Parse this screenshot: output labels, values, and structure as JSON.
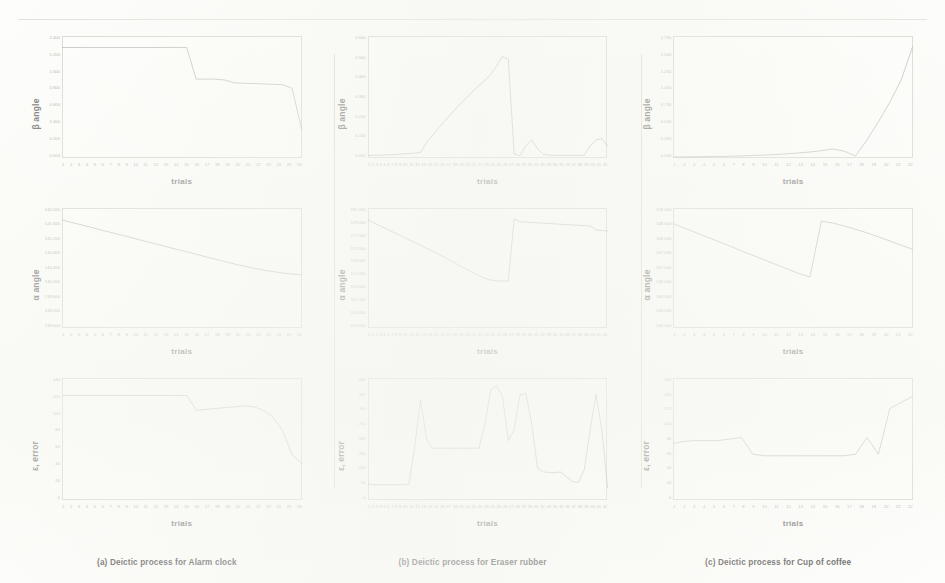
{
  "figure": {
    "background_color": "#fdfdfb",
    "line_color": "#9a9a94",
    "axis_color": "#d9d9d2",
    "columns": [
      {
        "key": "alarm_clock",
        "caption": "(a) Deictic process for Alarm clock"
      },
      {
        "key": "eraser_rubber",
        "caption": "(b) Deictic process for Eraser rubber"
      },
      {
        "key": "cup_of_coffee",
        "caption": "(c) Deictic process for Cup of coffee"
      }
    ],
    "rows": [
      {
        "key": "beta",
        "ylabel": "β angle"
      },
      {
        "key": "alpha",
        "ylabel": "α angle"
      },
      {
        "key": "error",
        "ylabel": "ε, error"
      }
    ],
    "xlabel": "trials"
  },
  "chart_data": [
    {
      "id": "a-beta",
      "type": "line",
      "title": "(a) Deictic process for Alarm clock — β angle",
      "xlabel": "trials",
      "ylabel": "β angle",
      "grid": false,
      "legend": "none",
      "xlim": [
        1,
        26
      ],
      "ylim": [
        0.0,
        1.4
      ],
      "yticks": [
        "1.400",
        "1.200",
        "1.000",
        "0.800",
        "0.600",
        "0.400",
        "0.200",
        "0.000"
      ],
      "xticks": [
        "1",
        "2",
        "3",
        "4",
        "5",
        "6",
        "7",
        "8",
        "9",
        "10",
        "11",
        "12",
        "13",
        "14",
        "15",
        "16",
        "17",
        "18",
        "19",
        "20",
        "21",
        "22",
        "23",
        "24",
        "25",
        "26"
      ],
      "x": [
        1,
        2,
        3,
        4,
        5,
        6,
        7,
        8,
        9,
        10,
        11,
        12,
        13,
        14,
        15,
        16,
        17,
        18,
        19,
        20,
        21,
        22,
        23,
        24,
        25,
        26
      ],
      "values": [
        1.268,
        1.268,
        1.268,
        1.268,
        1.268,
        1.268,
        1.268,
        1.268,
        1.268,
        1.268,
        1.268,
        1.268,
        1.268,
        1.268,
        0.905,
        0.905,
        0.905,
        0.895,
        0.862,
        0.858,
        0.854,
        0.85,
        0.846,
        0.842,
        0.8,
        0.33
      ]
    },
    {
      "id": "b-beta",
      "type": "line",
      "title": "(b) Deictic process for Eraser rubber — β angle",
      "xlabel": "trials",
      "ylabel": "β angle",
      "grid": false,
      "legend": "none",
      "xlim": [
        1,
        42
      ],
      "ylim": [
        0.0,
        0.6
      ],
      "yticks": [
        "0.600",
        "0.500",
        "0.400",
        "0.300",
        "0.200",
        "0.100",
        "0.000"
      ],
      "xticks": [
        "1",
        "2",
        "3",
        "4",
        "5",
        "6",
        "7",
        "8",
        "9",
        "10",
        "11",
        "12",
        "13",
        "14",
        "15",
        "16",
        "17",
        "18",
        "19",
        "20",
        "21",
        "22",
        "23",
        "24",
        "25",
        "26",
        "27",
        "28",
        "29",
        "30",
        "31",
        "32",
        "33",
        "34",
        "35",
        "36",
        "37",
        "38",
        "39",
        "40",
        "41",
        "42"
      ],
      "x": [
        1,
        2,
        3,
        4,
        5,
        6,
        7,
        8,
        9,
        10,
        11,
        12,
        13,
        14,
        15,
        16,
        17,
        18,
        19,
        20,
        21,
        22,
        23,
        24,
        25,
        26,
        27,
        28,
        29,
        30,
        31,
        32,
        33,
        34,
        35,
        36,
        37,
        38,
        39,
        40,
        41,
        42
      ],
      "values": [
        0.012,
        0.013,
        0.014,
        0.015,
        0.016,
        0.018,
        0.02,
        0.022,
        0.024,
        0.028,
        0.075,
        0.11,
        0.145,
        0.178,
        0.21,
        0.242,
        0.272,
        0.3,
        0.33,
        0.356,
        0.382,
        0.412,
        0.452,
        0.5,
        0.486,
        0.02,
        0.012,
        0.06,
        0.09,
        0.045,
        0.018,
        0.014,
        0.013,
        0.013,
        0.013,
        0.013,
        0.013,
        0.014,
        0.06,
        0.088,
        0.096,
        0.056
      ]
    },
    {
      "id": "c-beta",
      "type": "line",
      "title": "(c) Deictic process for Cup of coffee — β angle",
      "xlabel": "trials",
      "ylabel": "β angle",
      "grid": false,
      "legend": "none",
      "xlim": [
        1,
        22
      ],
      "ylim": [
        0.0,
        1.75
      ],
      "yticks": [
        "1.750",
        "1.500",
        "1.250",
        "1.000",
        "0.750",
        "0.500",
        "0.250",
        "0.000"
      ],
      "xticks": [
        "1",
        "2",
        "3",
        "4",
        "5",
        "6",
        "7",
        "8",
        "9",
        "10",
        "11",
        "12",
        "13",
        "14",
        "15",
        "16",
        "17",
        "18",
        "19",
        "20",
        "21",
        "22"
      ],
      "x": [
        1,
        2,
        3,
        4,
        5,
        6,
        7,
        8,
        9,
        10,
        11,
        12,
        13,
        14,
        15,
        16,
        17,
        18,
        19,
        20,
        21,
        22
      ],
      "values": [
        0.015,
        0.016,
        0.018,
        0.02,
        0.022,
        0.026,
        0.03,
        0.036,
        0.042,
        0.05,
        0.06,
        0.072,
        0.086,
        0.104,
        0.13,
        0.098,
        0.03,
        0.26,
        0.52,
        0.8,
        1.12,
        1.6
      ]
    },
    {
      "id": "a-alpha",
      "type": "line",
      "title": "(a) Deictic process for Alarm clock — α angle",
      "xlabel": "trials",
      "ylabel": "α angle",
      "grid": false,
      "legend": "none",
      "xlim": [
        1,
        26
      ],
      "ylim": [
        139.0,
        142.0
      ],
      "yticks": [
        "142.000",
        "141.600",
        "141.200",
        "140.800",
        "140.400",
        "140.000",
        "139.600",
        "139.200",
        "139.000"
      ],
      "xticks": [
        "1",
        "2",
        "3",
        "4",
        "5",
        "6",
        "7",
        "8",
        "9",
        "10",
        "11",
        "12",
        "13",
        "14",
        "15",
        "16",
        "17",
        "18",
        "19",
        "20",
        "21",
        "22",
        "23",
        "24",
        "25",
        "26"
      ],
      "x": [
        1,
        2,
        3,
        4,
        5,
        6,
        7,
        8,
        9,
        10,
        11,
        12,
        13,
        14,
        15,
        16,
        17,
        18,
        19,
        20,
        21,
        22,
        23,
        24,
        25,
        26
      ],
      "values": [
        141.7,
        141.64,
        141.58,
        141.52,
        141.455,
        141.395,
        141.335,
        141.275,
        141.21,
        141.15,
        141.09,
        141.025,
        140.965,
        140.905,
        140.845,
        140.78,
        140.72,
        140.66,
        140.6,
        140.545,
        140.495,
        140.45,
        140.41,
        140.375,
        140.345,
        140.33
      ]
    },
    {
      "id": "b-alpha",
      "type": "line",
      "title": "(b) Deictic process for Eraser rubber — α angle",
      "xlabel": "trials",
      "ylabel": "α angle",
      "grid": false,
      "legend": "none",
      "xlim": [
        1,
        42
      ],
      "ylim": [
        164.0,
        181.0
      ],
      "yticks": [
        "181.000",
        "179.000",
        "177.000",
        "175.000",
        "173.000",
        "171.000",
        "169.000",
        "167.000",
        "165.000",
        "164.000"
      ],
      "xticks": [
        "1",
        "2",
        "3",
        "4",
        "5",
        "6",
        "7",
        "8",
        "9",
        "10",
        "11",
        "12",
        "13",
        "14",
        "15",
        "16",
        "17",
        "18",
        "19",
        "20",
        "21",
        "22",
        "23",
        "24",
        "25",
        "26",
        "27",
        "28",
        "29",
        "30",
        "31",
        "32",
        "33",
        "34",
        "35",
        "36",
        "37",
        "38",
        "39",
        "40",
        "41",
        "42"
      ],
      "x": [
        1,
        2,
        3,
        4,
        5,
        6,
        7,
        8,
        9,
        10,
        11,
        12,
        13,
        14,
        15,
        16,
        17,
        18,
        19,
        20,
        21,
        22,
        23,
        24,
        25,
        26,
        27,
        28,
        29,
        30,
        31,
        32,
        33,
        34,
        35,
        36,
        37,
        38,
        39,
        40,
        41,
        42
      ],
      "values": [
        179.3,
        178.9,
        178.5,
        178.1,
        177.7,
        177.3,
        176.9,
        176.5,
        176.1,
        175.7,
        175.3,
        174.9,
        174.5,
        174.05,
        173.6,
        173.15,
        172.7,
        172.25,
        171.8,
        171.4,
        171.05,
        170.8,
        170.68,
        170.65,
        170.68,
        179.45,
        179.05,
        179.0,
        178.95,
        178.9,
        178.85,
        178.8,
        178.75,
        178.7,
        178.65,
        178.6,
        178.55,
        178.5,
        178.45,
        177.9,
        177.8,
        177.75
      ]
    },
    {
      "id": "c-alpha",
      "type": "line",
      "title": "(c) Deictic process for Cup of coffee — α angle",
      "xlabel": "trials",
      "ylabel": "α angle",
      "grid": false,
      "legend": "none",
      "xlim": [
        1,
        22
      ],
      "ylim": [
        145.0,
        149.0
      ],
      "yticks": [
        "149.000",
        "148.500",
        "148.000",
        "147.500",
        "147.000",
        "146.500",
        "146.000",
        "145.500",
        "145.000"
      ],
      "xticks": [
        "1",
        "2",
        "3",
        "4",
        "5",
        "6",
        "7",
        "8",
        "9",
        "10",
        "11",
        "12",
        "13",
        "14",
        "15",
        "16",
        "17",
        "18",
        "19",
        "20",
        "21",
        "22"
      ],
      "x": [
        1,
        2,
        3,
        4,
        5,
        6,
        7,
        8,
        9,
        10,
        11,
        12,
        13,
        14,
        15,
        16,
        17,
        18,
        19,
        20,
        21,
        22
      ],
      "values": [
        148.48,
        148.33,
        148.18,
        148.03,
        147.88,
        147.73,
        147.57,
        147.42,
        147.27,
        147.12,
        146.97,
        146.82,
        146.7,
        148.56,
        148.5,
        148.4,
        148.29,
        148.17,
        148.04,
        147.9,
        147.76,
        147.62
      ]
    },
    {
      "id": "a-error",
      "type": "line",
      "title": "(a) Deictic process for Alarm clock — ε, error",
      "xlabel": "trials",
      "ylabel": "ε, error",
      "grid": false,
      "legend": "none",
      "xlim": [
        1,
        26
      ],
      "ylim": [
        0,
        140
      ],
      "yticks": [
        "140",
        "120",
        "100",
        "80",
        "60",
        "40",
        "20",
        "0"
      ],
      "xticks": [
        "1",
        "2",
        "3",
        "4",
        "5",
        "6",
        "7",
        "8",
        "9",
        "10",
        "11",
        "12",
        "13",
        "14",
        "15",
        "16",
        "17",
        "18",
        "19",
        "20",
        "21",
        "22",
        "23",
        "24",
        "25",
        "26"
      ],
      "x": [
        1,
        2,
        3,
        4,
        5,
        6,
        7,
        8,
        9,
        10,
        11,
        12,
        13,
        14,
        15,
        16,
        17,
        18,
        19,
        20,
        21,
        22,
        23,
        24,
        25,
        26
      ],
      "values": [
        120,
        120,
        120,
        120,
        120,
        120,
        120,
        120,
        120,
        120,
        120,
        120,
        120,
        120,
        103,
        104,
        105,
        106,
        107,
        108,
        107,
        103,
        95,
        80,
        52,
        42
      ]
    },
    {
      "id": "b-error",
      "type": "line",
      "title": "(b) Deictic process for Eraser rubber — ε, error",
      "xlabel": "trials",
      "ylabel": "ε, error",
      "grid": false,
      "legend": "none",
      "xlim": [
        1,
        42
      ],
      "ylim": [
        0,
        400
      ],
      "yticks": [
        "400",
        "350",
        "300",
        "250",
        "200",
        "150",
        "100",
        "50",
        "0"
      ],
      "xticks": [
        "1",
        "2",
        "3",
        "4",
        "5",
        "6",
        "7",
        "8",
        "9",
        "10",
        "11",
        "12",
        "13",
        "14",
        "15",
        "16",
        "17",
        "18",
        "19",
        "20",
        "21",
        "22",
        "23",
        "24",
        "25",
        "26",
        "27",
        "28",
        "29",
        "30",
        "31",
        "32",
        "33",
        "34",
        "35",
        "36",
        "37",
        "38",
        "39",
        "40",
        "41",
        "42"
      ],
      "x": [
        1,
        2,
        3,
        4,
        5,
        6,
        7,
        8,
        9,
        10,
        11,
        12,
        13,
        14,
        15,
        16,
        17,
        18,
        19,
        20,
        21,
        22,
        23,
        24,
        25,
        26,
        27,
        28,
        29,
        30,
        31,
        32,
        33,
        34,
        35,
        36,
        37,
        38,
        39,
        40,
        41,
        42
      ],
      "values": [
        52,
        50,
        50,
        50,
        50,
        50,
        50,
        52,
        175,
        330,
        200,
        170,
        170,
        170,
        170,
        170,
        170,
        170,
        170,
        170,
        250,
        360,
        375,
        340,
        195,
        230,
        345,
        350,
        250,
        105,
        92,
        90,
        90,
        92,
        75,
        60,
        58,
        100,
        230,
        345,
        230,
        38
      ]
    },
    {
      "id": "c-error",
      "type": "line",
      "title": "(c) Deictic process for Cup of coffee — ε, error",
      "xlabel": "trials",
      "ylabel": "ε, error",
      "grid": false,
      "legend": "none",
      "xlim": [
        1,
        22
      ],
      "ylim": [
        0,
        160
      ],
      "yticks": [
        "160",
        "140",
        "120",
        "100",
        "80",
        "60",
        "40",
        "20",
        "0"
      ],
      "xticks": [
        "1",
        "2",
        "3",
        "4",
        "5",
        "6",
        "7",
        "8",
        "9",
        "10",
        "11",
        "12",
        "13",
        "14",
        "15",
        "16",
        "17",
        "18",
        "19",
        "20",
        "21",
        "22"
      ],
      "x": [
        1,
        2,
        3,
        4,
        5,
        6,
        7,
        8,
        9,
        10,
        11,
        12,
        13,
        14,
        15,
        16,
        17,
        18,
        19,
        20,
        21,
        22
      ],
      "values": [
        74,
        77,
        78,
        78,
        78,
        80,
        82,
        60,
        58,
        58,
        58,
        58,
        58,
        58,
        58,
        58,
        60,
        82,
        60,
        120,
        128,
        136
      ]
    }
  ]
}
